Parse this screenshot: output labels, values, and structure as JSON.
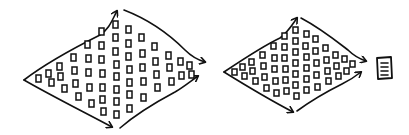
{
  "diagram": {
    "title": "Double diamond process",
    "stroke_color": "#111111",
    "background_color": "#ffffff",
    "stages": [
      {
        "id": "diamond-1",
        "label": "Diverge then converge (first diamond)",
        "idea_count": 62
      },
      {
        "id": "diamond-2",
        "label": "Diverge then converge (second diamond)",
        "idea_count": 52
      },
      {
        "id": "output",
        "label": "Document",
        "icon": "document-icon"
      }
    ]
  }
}
